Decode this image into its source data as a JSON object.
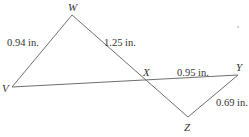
{
  "diagram": {
    "type": "geometry-figure",
    "colors": {
      "line": "#6e6e6e",
      "text": "#333333",
      "background": "#ffffff"
    },
    "vertices": {
      "W": {
        "label": "W",
        "x": 72,
        "y": 15
      },
      "V": {
        "label": "V",
        "x": 12,
        "y": 87
      },
      "X": {
        "label": "X",
        "x": 142,
        "y": 80
      },
      "Y": {
        "label": "Y",
        "x": 238,
        "y": 75
      },
      "Z": {
        "label": "Z",
        "x": 188,
        "y": 117
      }
    },
    "measurements": {
      "WV": "0.94 in.",
      "WX": "1.25 in.",
      "XY": "0.95 in.",
      "YZ": "0.69 in."
    },
    "segments": [
      {
        "from": "W",
        "to": "V"
      },
      {
        "from": "W",
        "to": "Z"
      },
      {
        "from": "V",
        "to": "Y"
      },
      {
        "from": "Y",
        "to": "Z"
      }
    ]
  }
}
